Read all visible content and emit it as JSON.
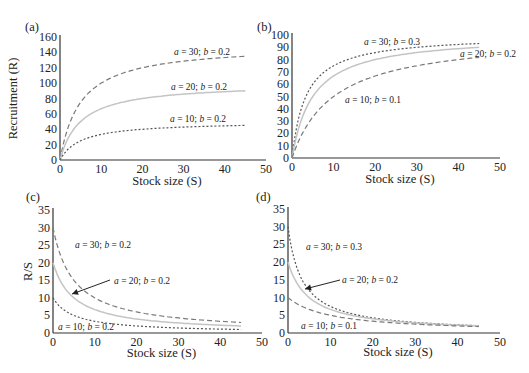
{
  "figure": {
    "panels": [
      "(a)",
      "(b)",
      "(c)",
      "(d)"
    ]
  },
  "chart_data": [
    {
      "panel": "(a)",
      "type": "line",
      "title": "",
      "xlabel": "Stock size (S)",
      "ylabel": "Recruitment (R)",
      "xlim": [
        0,
        50
      ],
      "ylim": [
        0,
        160
      ],
      "xticks": [
        0,
        10,
        20,
        30,
        40,
        50
      ],
      "yticks": [
        0,
        20,
        40,
        60,
        80,
        100,
        120,
        140,
        160
      ],
      "grid": false,
      "model": "R = aS / (1 + bS)",
      "x": [
        0,
        1,
        2,
        3,
        5,
        7,
        10,
        15,
        20,
        25,
        30,
        35,
        40,
        45
      ],
      "series": [
        {
          "name": "a = 30; b = 0.2",
          "a": 30,
          "b": 0.2,
          "style": "long-dash",
          "values": [
            0,
            25,
            42.9,
            56.3,
            75,
            87.5,
            100,
            112.5,
            120,
            125,
            128.6,
            131.3,
            133.3,
            135
          ]
        },
        {
          "name": "a = 20; b = 0.2",
          "a": 20,
          "b": 0.2,
          "style": "solid-light",
          "values": [
            0,
            16.7,
            28.6,
            37.5,
            50,
            58.3,
            66.7,
            75,
            80,
            83.3,
            85.7,
            87.5,
            88.9,
            90
          ]
        },
        {
          "name": "a = 10; b = 0.2",
          "a": 10,
          "b": 0.2,
          "style": "dotted",
          "values": [
            0,
            8.3,
            14.3,
            18.8,
            25,
            29.2,
            33.3,
            37.5,
            40,
            41.7,
            42.9,
            43.8,
            44.4,
            45
          ]
        }
      ],
      "annotations": [
        {
          "text_a": "a",
          "text_eq1": " = 30; ",
          "text_b": "b",
          "text_eq2": " = 0.2",
          "x": 174,
          "y": 55
        },
        {
          "text_a": "a",
          "text_eq1": " = 20; ",
          "text_b": "b",
          "text_eq2": " = 0.2",
          "x": 171,
          "y": 90
        },
        {
          "text_a": "a",
          "text_eq1": " = 10; ",
          "text_b": "b",
          "text_eq2": " = 0.2",
          "x": 170,
          "y": 122
        }
      ]
    },
    {
      "panel": "(b)",
      "type": "line",
      "title": "",
      "xlabel": "Stock size (S)",
      "ylabel": "",
      "xlim": [
        0,
        50
      ],
      "ylim": [
        0,
        100
      ],
      "xticks": [
        0,
        10,
        20,
        30,
        40,
        50
      ],
      "yticks": [
        0,
        10,
        20,
        30,
        40,
        50,
        60,
        70,
        80,
        90,
        100
      ],
      "grid": false,
      "model": "R = aS / (1 + bS)",
      "x": [
        0,
        1,
        2,
        3,
        5,
        7,
        10,
        15,
        20,
        25,
        30,
        35,
        40,
        45
      ],
      "series": [
        {
          "name": "a = 30; b = 0.3",
          "a": 30,
          "b": 0.3,
          "style": "dotted",
          "values": [
            0,
            23.1,
            37.5,
            47.4,
            60,
            67.7,
            75,
            81.8,
            85.7,
            88.2,
            90,
            91.3,
            92.3,
            93.1
          ]
        },
        {
          "name": "a = 20; b = 0.2",
          "a": 20,
          "b": 0.2,
          "style": "solid-light",
          "values": [
            0,
            16.7,
            28.6,
            37.5,
            50,
            58.3,
            66.7,
            75,
            80,
            83.3,
            85.7,
            87.5,
            88.9,
            90
          ]
        },
        {
          "name": "a = 10; b = 0.1",
          "a": 10,
          "b": 0.1,
          "style": "long-dash",
          "values": [
            0,
            9.1,
            16.7,
            23.1,
            33.3,
            41.2,
            50,
            60,
            66.7,
            71.4,
            75,
            77.8,
            80,
            81.8
          ]
        }
      ],
      "annotations": [
        {
          "text_a": "a",
          "text_eq1": " = 30; ",
          "text_b": "b",
          "text_eq2": " = 0.3",
          "x": 364,
          "y": 45
        },
        {
          "text_a": "a",
          "text_eq1": " = 20; ",
          "text_b": "b",
          "text_eq2": " = 0.2",
          "x": 460,
          "y": 57
        },
        {
          "text_a": "a",
          "text_eq1": " = 10; ",
          "text_b": "b",
          "text_eq2": " = 0.1",
          "x": 345,
          "y": 103
        }
      ]
    },
    {
      "panel": "(c)",
      "type": "line",
      "title": "",
      "xlabel": "Stock size (S)",
      "ylabel": "R/S",
      "xlim": [
        0,
        50
      ],
      "ylim": [
        0,
        35
      ],
      "xticks": [
        0,
        10,
        20,
        30,
        40,
        50
      ],
      "yticks": [
        0,
        5,
        10,
        15,
        20,
        25,
        30,
        35
      ],
      "grid": false,
      "model": "R/S = a / (1 + bS)",
      "x": [
        0,
        1,
        2,
        3,
        5,
        7,
        10,
        15,
        20,
        25,
        30,
        35,
        40,
        45
      ],
      "series": [
        {
          "name": "a = 30; b = 0.2",
          "a": 30,
          "b": 0.2,
          "style": "long-dash",
          "values": [
            30,
            25,
            21.4,
            18.8,
            15,
            12.5,
            10,
            7.5,
            6,
            5,
            4.3,
            3.8,
            3.3,
            3
          ]
        },
        {
          "name": "a = 20; b = 0.2",
          "a": 20,
          "b": 0.2,
          "style": "solid-light",
          "values": [
            20,
            16.7,
            14.3,
            12.5,
            10,
            8.3,
            6.7,
            5,
            4,
            3.3,
            2.9,
            2.5,
            2.2,
            2
          ]
        },
        {
          "name": "a = 10; b = 0.2",
          "a": 10,
          "b": 0.2,
          "style": "dotted",
          "values": [
            10,
            8.3,
            7.1,
            6.3,
            5,
            4.2,
            3.3,
            2.5,
            2,
            1.7,
            1.4,
            1.3,
            1.1,
            1
          ]
        }
      ],
      "annotations": [
        {
          "text_a": "a",
          "text_eq1": " = 30; ",
          "text_b": "b",
          "text_eq2": " = 0.2",
          "x": 75,
          "y": 248
        },
        {
          "text_a": "a",
          "text_eq1": " = 20; ",
          "text_b": "b",
          "text_eq2": " = 0.2",
          "x": 114,
          "y": 284
        },
        {
          "text_a": "a",
          "text_eq1": " = 10; ",
          "text_b": "b",
          "text_eq2": " = 0.2",
          "x": 58,
          "y": 330
        }
      ],
      "arrow": {
        "x1": 110,
        "y1": 280,
        "x2": 72,
        "y2": 294
      }
    },
    {
      "panel": "(d)",
      "type": "line",
      "title": "",
      "xlabel": "Stock size (S)",
      "ylabel": "",
      "xlim": [
        0,
        50
      ],
      "ylim": [
        0,
        35
      ],
      "xticks": [
        0,
        10,
        20,
        30,
        40,
        50
      ],
      "yticks": [
        0,
        5,
        10,
        15,
        20,
        25,
        30,
        35
      ],
      "grid": false,
      "model": "R/S = a / (1 + bS)",
      "x": [
        0,
        1,
        2,
        3,
        5,
        7,
        10,
        15,
        20,
        25,
        30,
        35,
        40,
        45
      ],
      "series": [
        {
          "name": "a = 30; b = 0.3",
          "a": 30,
          "b": 0.3,
          "style": "dotted",
          "values": [
            30,
            23.1,
            18.8,
            15.8,
            12,
            9.7,
            7.5,
            5.5,
            4.3,
            3.5,
            3,
            2.6,
            2.3,
            2.1
          ]
        },
        {
          "name": "a = 20; b = 0.2",
          "a": 20,
          "b": 0.2,
          "style": "solid-light",
          "values": [
            20,
            16.7,
            14.3,
            12.5,
            10,
            8.3,
            6.7,
            5,
            4,
            3.3,
            2.9,
            2.5,
            2.2,
            2
          ]
        },
        {
          "name": "a = 10; b = 0.1",
          "a": 10,
          "b": 0.1,
          "style": "long-dash",
          "values": [
            10,
            9.1,
            8.3,
            7.7,
            6.7,
            5.9,
            5,
            4,
            3.3,
            2.9,
            2.5,
            2.2,
            2,
            1.8
          ]
        }
      ],
      "annotations": [
        {
          "text_a": "a",
          "text_eq1": " = 30; ",
          "text_b": "b",
          "text_eq2": " = 0.3",
          "x": 306,
          "y": 250
        },
        {
          "text_a": "a",
          "text_eq1": " = 20; ",
          "text_b": "b",
          "text_eq2": " = 0.2",
          "x": 342,
          "y": 283
        },
        {
          "text_a": "a",
          "text_eq1": " = 10; ",
          "text_b": "b",
          "text_eq2": " = 0.1",
          "x": 301,
          "y": 329
        }
      ],
      "arrow": {
        "x1": 340,
        "y1": 280,
        "x2": 305,
        "y2": 289
      }
    }
  ],
  "styles": {
    "axis_color": "#333333",
    "long_dash_color": "#7a7a7a",
    "solid_light_color": "#c4c4c4",
    "dotted_color": "#555555"
  }
}
